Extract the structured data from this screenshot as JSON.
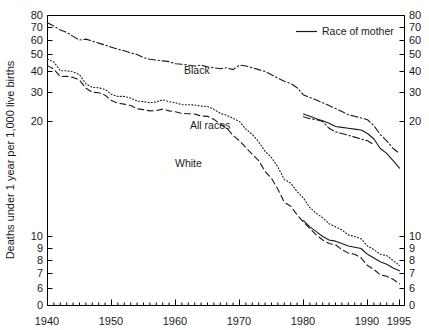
{
  "chart_data": {
    "type": "line",
    "title": "",
    "xlabel": "",
    "ylabel": "Deaths under 1 year per 1,000 live births",
    "xlim": [
      1940,
      1995
    ],
    "ylim": [
      5.5,
      80
    ],
    "yscale": "log",
    "grid": false,
    "legend_position": "top-right",
    "y_ticks_left": [
      "80",
      "70",
      "60",
      "50",
      "40",
      "30",
      "20",
      "10",
      "9",
      "8",
      "7",
      "6",
      "0"
    ],
    "y_ticks_right": [
      "80",
      "70",
      "60",
      "50",
      "40",
      "30",
      "20",
      "10",
      "9",
      "8",
      "7",
      "6",
      "0"
    ],
    "y_tick_values": [
      80,
      70,
      60,
      50,
      40,
      30,
      20,
      10,
      9,
      8,
      7,
      6,
      0
    ],
    "x_ticks": [
      "1940",
      "1950",
      "1960",
      "1970",
      "1980",
      "1990",
      "1995"
    ],
    "x_tick_values": [
      1940,
      1950,
      1960,
      1970,
      1980,
      1990,
      1995
    ],
    "x_minor_step": 1,
    "annotations": [
      {
        "text": "Black",
        "x": 1962,
        "y": 46.5
      },
      {
        "text": "All races",
        "x": 1964,
        "y": 25.5
      },
      {
        "text": "White",
        "x": 1962,
        "y": 18.2
      }
    ],
    "legend": [
      {
        "label": "Race of mother",
        "style": "solid"
      }
    ],
    "series": [
      {
        "name": "Black",
        "style": "dash-dot",
        "x": [
          1940,
          1941,
          1942,
          1943,
          1944,
          1945,
          1946,
          1947,
          1948,
          1949,
          1950,
          1951,
          1952,
          1953,
          1954,
          1955,
          1956,
          1957,
          1958,
          1959,
          1960,
          1961,
          1962,
          1963,
          1964,
          1965,
          1966,
          1967,
          1968,
          1969,
          1970,
          1971,
          1972,
          1973,
          1974,
          1975,
          1976,
          1977,
          1978,
          1979,
          1980,
          1981,
          1982,
          1983,
          1984,
          1985,
          1986,
          1987,
          1988,
          1989,
          1990,
          1991,
          1992,
          1993,
          1994,
          1995
        ],
        "values": [
          73.8,
          71.0,
          68.0,
          66.0,
          63.0,
          60.3,
          61.0,
          59.5,
          58.0,
          56.5,
          55.0,
          53.5,
          52.5,
          51.0,
          50.0,
          48.0,
          47.0,
          46.5,
          46.0,
          45.5,
          44.3,
          44.0,
          43.5,
          43.0,
          43.5,
          42.5,
          42.0,
          41.5,
          42.0,
          41.0,
          43.5,
          43.0,
          42.0,
          41.0,
          40.0,
          38.3,
          36.5,
          35.0,
          34.0,
          32.0,
          29.0,
          28.0,
          27.0,
          26.0,
          25.0,
          24.0,
          23.0,
          22.0,
          21.5,
          21.0,
          20.5,
          19.5,
          18.5,
          17.8,
          17.0,
          16.5
        ],
        "note": "Race of child through 1979; continues as race-of-mother-adjusted after 1980"
      },
      {
        "name": "Black (race of mother)",
        "style": "solid",
        "x": [
          1980,
          1981,
          1982,
          1983,
          1984,
          1985,
          1986,
          1987,
          1988,
          1989,
          1990,
          1991,
          1992,
          1993,
          1994,
          1995
        ],
        "values": [
          22.2,
          21.5,
          20.8,
          20.2,
          19.8,
          19.4,
          19.3,
          19.2,
          19.1,
          19.0,
          18.6,
          18.0,
          17.0,
          16.5,
          15.8,
          15.1
        ]
      },
      {
        "name": "Black (race of child)",
        "style": "dash-dot-tail",
        "x": [
          1980,
          1981,
          1982,
          1983,
          1984,
          1985,
          1986,
          1987,
          1988,
          1989,
          1990,
          1991
        ],
        "values": [
          21.4,
          20.8,
          20.5,
          20.0,
          19.2,
          18.8,
          18.6,
          18.4,
          18.2,
          18.0,
          17.8,
          17.4
        ]
      },
      {
        "name": "All races",
        "style": "dotted",
        "x": [
          1940,
          1941,
          1942,
          1943,
          1944,
          1945,
          1946,
          1947,
          1948,
          1949,
          1950,
          1951,
          1952,
          1953,
          1954,
          1955,
          1956,
          1957,
          1958,
          1959,
          1960,
          1961,
          1962,
          1963,
          1964,
          1965,
          1966,
          1967,
          1968,
          1969,
          1970,
          1971,
          1972,
          1973,
          1974,
          1975,
          1976,
          1977,
          1978,
          1979,
          1980,
          1981,
          1982,
          1983,
          1984,
          1985,
          1986,
          1987,
          1988,
          1989,
          1990,
          1991,
          1992,
          1993,
          1994,
          1995
        ],
        "values": [
          47.0,
          45.3,
          40.4,
          40.4,
          39.8,
          38.3,
          33.8,
          32.2,
          32.0,
          31.3,
          29.2,
          28.4,
          28.4,
          27.8,
          26.6,
          26.4,
          26.0,
          26.3,
          27.1,
          26.4,
          26.0,
          25.3,
          25.3,
          25.2,
          24.8,
          24.7,
          23.7,
          22.4,
          21.8,
          20.9,
          20.0,
          19.1,
          18.5,
          17.7,
          16.7,
          16.1,
          15.2,
          14.1,
          13.8,
          13.1,
          12.6,
          11.9,
          11.5,
          11.2,
          10.8,
          10.6,
          10.4,
          10.1,
          10.0,
          9.8,
          9.2,
          8.9,
          8.5,
          8.4,
          8.0,
          7.6
        ]
      },
      {
        "name": "White",
        "style": "dashed",
        "x": [
          1940,
          1941,
          1942,
          1943,
          1944,
          1945,
          1946,
          1947,
          1948,
          1949,
          1950,
          1951,
          1952,
          1953,
          1954,
          1955,
          1956,
          1957,
          1958,
          1959,
          1960,
          1961,
          1962,
          1963,
          1964,
          1965,
          1966,
          1967,
          1968,
          1969,
          1970,
          1971,
          1972,
          1973,
          1974,
          1975,
          1976,
          1977,
          1978,
          1979,
          1980,
          1981,
          1982,
          1983,
          1984,
          1985,
          1986,
          1987,
          1988,
          1989,
          1990,
          1991,
          1992,
          1993,
          1994,
          1995
        ],
        "values": [
          43.2,
          41.2,
          37.3,
          37.5,
          36.9,
          35.6,
          31.8,
          30.1,
          29.9,
          28.9,
          26.8,
          25.8,
          25.5,
          25.0,
          23.9,
          23.6,
          23.2,
          23.3,
          23.8,
          23.2,
          22.9,
          22.4,
          22.3,
          22.2,
          21.6,
          21.5,
          20.6,
          19.7,
          19.2,
          18.4,
          17.8,
          17.1,
          16.4,
          15.8,
          14.8,
          14.2,
          13.3,
          12.3,
          12.0,
          11.4,
          10.9,
          10.5,
          10.1,
          9.7,
          9.4,
          9.3,
          8.9,
          8.6,
          8.5,
          8.2,
          7.6,
          7.3,
          6.9,
          6.8,
          6.6,
          6.3
        ]
      },
      {
        "name": "White (race of mother)",
        "style": "solid",
        "x": [
          1980,
          1981,
          1982,
          1983,
          1984,
          1985,
          1986,
          1987,
          1988,
          1989,
          1990,
          1991,
          1992,
          1993,
          1994,
          1995
        ],
        "values": [
          11.0,
          10.6,
          10.3,
          10.0,
          9.7,
          9.6,
          9.4,
          9.2,
          9.1,
          9.0,
          8.5,
          8.2,
          7.9,
          7.7,
          7.4,
          7.2
        ]
      }
    ]
  },
  "axis": {
    "y_title": "Deaths under 1 year per 1,000 live births"
  },
  "legend": {
    "race_of_mother": "Race of mother"
  },
  "labels": {
    "black": "Black",
    "all_races": "All races",
    "white": "White"
  },
  "colors": {
    "line": "#1a1a1a",
    "axis": "#000000",
    "background": "#ffffff"
  }
}
